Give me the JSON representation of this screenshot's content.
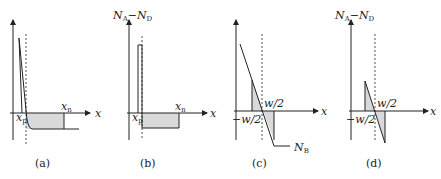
{
  "figure": {
    "panels": [
      {
        "id": "a",
        "caption": "(a)",
        "x_axis_label": "x",
        "y_axis_label": "",
        "labels": {
          "left": "x",
          "left_sub": "p",
          "right": "x",
          "right_sub": "n"
        }
      },
      {
        "id": "b",
        "caption": "(b)",
        "x_axis_label": "x",
        "y_axis_label": "N_A−N_D",
        "y_label_main1": "N",
        "y_label_sub1": "A",
        "y_label_dash": "−",
        "y_label_main2": "N",
        "y_label_sub2": "D",
        "labels": {
          "left": "x",
          "left_sub": "p",
          "right": "x",
          "right_sub": "n"
        }
      },
      {
        "id": "c",
        "caption": "(c)",
        "x_axis_label": "x",
        "y_axis_label": "",
        "labels": {
          "left": "−w/2",
          "right": "w/2",
          "curve": "N",
          "curve_sub": "B"
        }
      },
      {
        "id": "d",
        "caption": "(d)",
        "x_axis_label": "x",
        "y_axis_label": "N_A−N_D",
        "y_label_main1": "N",
        "y_label_sub1": "A",
        "y_label_dash": "−",
        "y_label_main2": "N",
        "y_label_sub2": "D",
        "labels": {
          "left": "−w/2",
          "right": "w/2"
        }
      }
    ],
    "colors": {
      "line": "#222222",
      "fill": "#d9d9d9"
    }
  }
}
